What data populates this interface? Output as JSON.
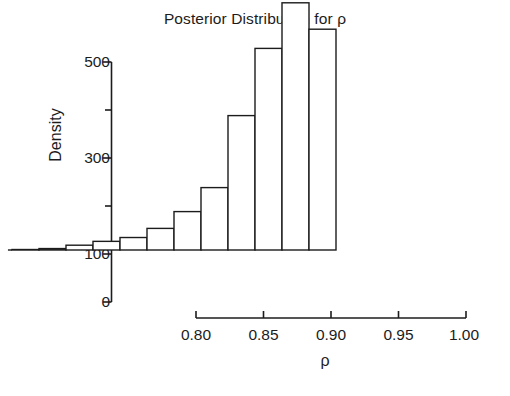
{
  "chart_data": {
    "type": "bar",
    "subtype": "histogram",
    "title": "Posterior Distribution for ρ",
    "xlabel": "ρ",
    "ylabel": "Density",
    "xlim": [
      0.755,
      1.005
    ],
    "ylim": [
      0,
      540
    ],
    "grid": false,
    "legend": null,
    "bin_width": 0.02,
    "bin_edges": [
      0.76,
      0.78,
      0.8,
      0.82,
      0.84,
      0.86,
      0.88,
      0.9,
      0.92,
      0.94,
      0.96,
      0.98,
      1.0
    ],
    "categories": [
      "0.76-0.78",
      "0.78-0.80",
      "0.80-0.82",
      "0.82-0.84",
      "0.84-0.86",
      "0.86-0.88",
      "0.88-0.90",
      "0.90-0.92",
      "0.92-0.94",
      "0.94-0.96",
      "0.96-0.98",
      "0.98-1.00"
    ],
    "values": [
      1,
      3,
      10,
      18,
      26,
      45,
      80,
      130,
      280,
      420,
      515,
      460
    ],
    "x_ticks": [
      0.8,
      0.85,
      0.9,
      0.95,
      1.0
    ],
    "x_tick_labels": [
      "0.80",
      "0.85",
      "0.90",
      "0.95",
      "1.00"
    ],
    "y_ticks": [
      0,
      100,
      200,
      300,
      400,
      500
    ],
    "y_tick_labels": [
      "0",
      "",
      "100",
      "",
      "300",
      "",
      "500"
    ],
    "y_major_ticks": [
      0,
      100,
      300,
      500
    ],
    "y_major_tick_labels": [
      "0",
      "100",
      "300",
      "500"
    ],
    "y_minor_ticks": [
      200,
      400
    ],
    "bar_fill": "#ffffff",
    "bar_stroke": "#1c1c1c",
    "axis_color": "#1c1c1c",
    "background": "#ffffff"
  },
  "labels": {
    "title": "Posterior Distribution for ρ",
    "y_axis_title": "Density",
    "x_axis_title": "ρ",
    "y_500": "500",
    "y_300": "300",
    "y_100": "100",
    "y_0": "0",
    "x_080": "0.80",
    "x_085": "0.85",
    "x_090": "0.90",
    "x_095": "0.95",
    "x_100": "1.00"
  }
}
